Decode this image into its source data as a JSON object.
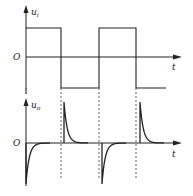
{
  "diagram": {
    "upper_plot": {
      "y_label": "u",
      "y_label_sub": "i",
      "origin_label": "O",
      "x_label": "t",
      "signal": "square-wave",
      "levels": {
        "high": 1,
        "low": -1
      },
      "transitions": [
        {
          "edge": "falling",
          "at_period_fraction": 0.5
        },
        {
          "edge": "rising",
          "at_period_fraction": 1.0
        },
        {
          "edge": "falling",
          "at_period_fraction": 1.5
        }
      ]
    },
    "lower_plot": {
      "y_label": "u",
      "y_label_sub": "o",
      "origin_label": "O",
      "x_label": "t",
      "signal": "differentiated-spikes",
      "spikes": [
        {
          "polarity": "negative",
          "at_period_fraction": 0.0
        },
        {
          "polarity": "positive",
          "at_period_fraction": 0.5
        },
        {
          "polarity": "negative",
          "at_period_fraction": 1.0
        },
        {
          "polarity": "positive",
          "at_period_fraction": 1.5
        }
      ]
    }
  }
}
